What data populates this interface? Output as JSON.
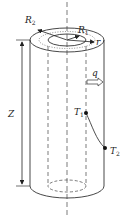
{
  "diagram": {
    "labels": {
      "outer_radius": "R",
      "outer_radius_sub": "2",
      "inner_radius": "R",
      "inner_radius_sub": "1",
      "radius": "r",
      "height": "Z",
      "heat_flux": "q",
      "temp_inner": "T",
      "temp_inner_sub": "1",
      "temp_outer": "T",
      "temp_outer_sub": "2"
    },
    "colors": {
      "stroke": "#333333",
      "background": "#ffffff"
    }
  }
}
